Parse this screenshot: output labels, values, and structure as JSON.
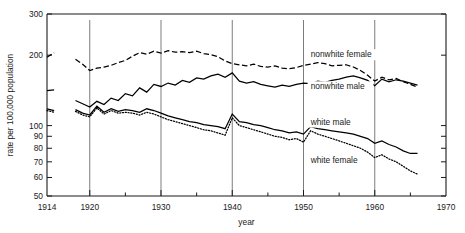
{
  "chart_data": {
    "type": "line",
    "title": "",
    "xlabel": "year",
    "ylabel": "rate per 100,000 population",
    "yscale": "log",
    "ylim": [
      50,
      300
    ],
    "xlim": [
      1914,
      1970
    ],
    "grid": "vertical gridlines at 1920, 1930, 1940, 1950, 1960",
    "legend_position": "inline annotations at right of each curve",
    "y_ticks": [
      50,
      60,
      70,
      80,
      90,
      100,
      200,
      300
    ],
    "y_tick_labels": [
      "50",
      "60",
      "70",
      "80",
      "90",
      "100",
      "200",
      "300"
    ],
    "x_ticks_major": [
      1914,
      1920,
      1930,
      1940,
      1950,
      1960,
      1970
    ],
    "x_tick_labels": [
      "1914",
      "1920",
      "1930",
      "1940",
      "1950",
      "1960",
      "1970"
    ],
    "x_ticks_minor": [
      1925,
      1935,
      1945,
      1955,
      1965
    ],
    "gridlines_x": [
      1920,
      1930,
      1940,
      1950,
      1960
    ],
    "annotations": [
      {
        "text": "nonwhite female",
        "x": 1951,
        "y": 196
      },
      {
        "text": "nonwhite male",
        "x": 1951,
        "y": 143
      },
      {
        "text": "white male",
        "x": 1951,
        "y": 101
      },
      {
        "text": "white female",
        "x": 1951,
        "y": 69
      }
    ],
    "series": [
      {
        "name": "nonwhite female",
        "style": "dashed",
        "x": [
          1914,
          1915,
          1918,
          1919,
          1920,
          1921,
          1922,
          1923,
          1924,
          1925,
          1926,
          1927,
          1928,
          1929,
          1930,
          1931,
          1932,
          1933,
          1934,
          1935,
          1936,
          1937,
          1938,
          1939,
          1940,
          1941,
          1942,
          1943,
          1944,
          1945,
          1946,
          1947,
          1948,
          1949,
          1950,
          1951,
          1952,
          1953,
          1954,
          1955,
          1956,
          1957,
          1958,
          1959,
          1960,
          1961,
          1962,
          1963,
          1964,
          1965,
          1966
        ],
        "y": [
          196,
          205,
          192,
          183,
          172,
          176,
          178,
          181,
          186,
          190,
          198,
          205,
          202,
          208,
          204,
          209,
          206,
          207,
          205,
          208,
          203,
          201,
          197,
          189,
          184,
          182,
          180,
          183,
          179,
          178,
          180,
          176,
          175,
          177,
          181,
          183,
          186,
          184,
          180,
          181,
          182,
          178,
          172,
          164,
          155,
          161,
          157,
          159,
          154,
          150,
          146
        ]
      },
      {
        "name": "nonwhite male",
        "style": "solid",
        "x": [
          1914,
          1915,
          1918,
          1919,
          1920,
          1921,
          1922,
          1923,
          1924,
          1925,
          1926,
          1927,
          1928,
          1929,
          1930,
          1931,
          1932,
          1933,
          1934,
          1935,
          1936,
          1937,
          1938,
          1939,
          1940,
          1941,
          1942,
          1943,
          1944,
          1945,
          1946,
          1947,
          1948,
          1949,
          1950,
          1951,
          1952,
          1953,
          1954,
          1955,
          1956,
          1957,
          1958,
          1959,
          1960,
          1961,
          1962,
          1963,
          1964,
          1965,
          1966
        ],
        "y": [
          141,
          142,
          128,
          124,
          120,
          127,
          123,
          131,
          128,
          137,
          134,
          145,
          139,
          150,
          147,
          152,
          149,
          156,
          153,
          160,
          158,
          163,
          166,
          161,
          168,
          155,
          152,
          154,
          150,
          148,
          146,
          149,
          147,
          150,
          152,
          151,
          155,
          153,
          156,
          158,
          161,
          163,
          160,
          156,
          148,
          158,
          154,
          157,
          155,
          152,
          149
        ]
      },
      {
        "name": "white male",
        "style": "solid",
        "x": [
          1914,
          1915,
          1918,
          1919,
          1920,
          1921,
          1922,
          1923,
          1924,
          1925,
          1926,
          1927,
          1928,
          1929,
          1930,
          1931,
          1932,
          1933,
          1934,
          1935,
          1936,
          1937,
          1938,
          1939,
          1940,
          1941,
          1942,
          1943,
          1944,
          1945,
          1946,
          1947,
          1948,
          1949,
          1950,
          1951,
          1952,
          1953,
          1954,
          1955,
          1956,
          1957,
          1958,
          1959,
          1960,
          1961,
          1962,
          1963,
          1964,
          1965,
          1966
        ],
        "y": [
          118,
          116,
          117,
          113,
          111,
          121,
          114,
          118,
          115,
          117,
          116,
          114,
          118,
          116,
          113,
          110,
          108,
          106,
          104,
          103,
          101,
          100,
          99,
          97,
          112,
          104,
          103,
          101,
          100,
          98,
          96,
          95,
          93,
          94,
          92,
          99,
          97,
          96,
          95,
          94,
          93,
          92,
          90,
          88,
          84,
          86,
          83,
          81,
          78,
          76,
          76
        ]
      },
      {
        "name": "white female",
        "style": "dotted",
        "x": [
          1914,
          1915,
          1918,
          1919,
          1920,
          1921,
          1922,
          1923,
          1924,
          1925,
          1926,
          1927,
          1928,
          1929,
          1930,
          1931,
          1932,
          1933,
          1934,
          1935,
          1936,
          1937,
          1938,
          1939,
          1940,
          1941,
          1942,
          1943,
          1944,
          1945,
          1946,
          1947,
          1948,
          1949,
          1950,
          1951,
          1952,
          1953,
          1954,
          1955,
          1956,
          1957,
          1958,
          1959,
          1960,
          1961,
          1962,
          1963,
          1964,
          1965,
          1966
        ],
        "y": [
          116,
          114,
          115,
          111,
          109,
          119,
          112,
          116,
          113,
          114,
          113,
          111,
          114,
          112,
          109,
          106,
          104,
          102,
          100,
          98,
          96,
          95,
          93,
          91,
          108,
          100,
          98,
          96,
          94,
          92,
          90,
          89,
          87,
          88,
          85,
          95,
          92,
          90,
          88,
          86,
          84,
          82,
          80,
          77,
          73,
          75,
          72,
          70,
          67,
          64,
          62
        ]
      }
    ]
  }
}
